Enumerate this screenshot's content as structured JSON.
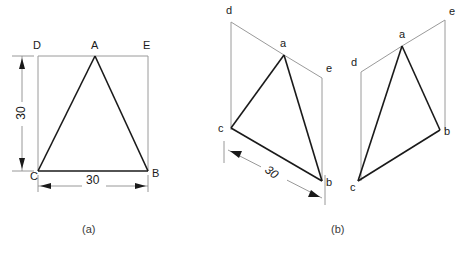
{
  "figure": {
    "caption_a": "(a)",
    "caption_b": "(b)",
    "footer_fragment": ""
  },
  "colors": {
    "construction_line": "#9a9a9a",
    "object_line": "#1a1a1a",
    "dimension_line": "#8c8c8c",
    "text": "#1a1a1a",
    "background": "#ffffff"
  },
  "view_a": {
    "name": "orthographic-view",
    "vertices": {
      "D": "D",
      "A": "A",
      "E": "E",
      "C": "C",
      "B": "B"
    },
    "dimensions": {
      "height": "30",
      "width": "30"
    }
  },
  "view_b": {
    "name": "pictorial-views",
    "left_view": {
      "vertices": {
        "d": "d",
        "a": "a",
        "e": "e",
        "c": "c",
        "b": "b"
      },
      "dimensions": {
        "edge_cb": "30"
      }
    },
    "right_view": {
      "vertices": {
        "a": "a",
        "e": "e",
        "d": "d",
        "b": "b",
        "c": "c"
      }
    }
  }
}
